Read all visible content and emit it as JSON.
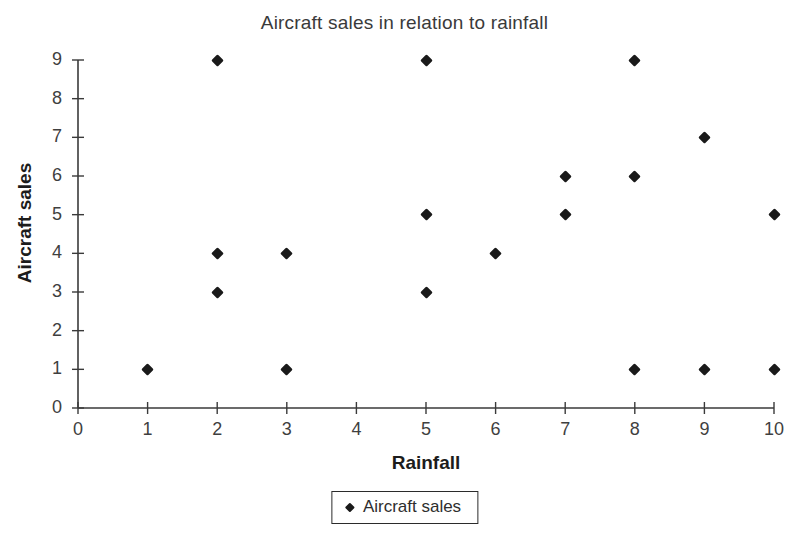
{
  "chart_data": {
    "type": "scatter",
    "title": "Aircraft sales in relation to rainfall",
    "xlabel": "Rainfall",
    "ylabel": "Aircraft sales",
    "xlim": [
      0,
      10
    ],
    "ylim": [
      0,
      9
    ],
    "xticks": [
      "0",
      "1",
      "2",
      "3",
      "4",
      "5",
      "6",
      "7",
      "8",
      "9",
      "10"
    ],
    "yticks": [
      "0",
      "1",
      "2",
      "3",
      "4",
      "5",
      "6",
      "7",
      "8",
      "9"
    ],
    "grid": false,
    "legend_position": "bottom-center",
    "marker": "diamond",
    "marker_color": "#1a1a1a",
    "series": [
      {
        "name": "Aircraft sales",
        "points": [
          [
            1,
            1
          ],
          [
            2,
            9
          ],
          [
            2,
            4
          ],
          [
            2,
            3
          ],
          [
            3,
            4
          ],
          [
            3,
            1
          ],
          [
            5,
            9
          ],
          [
            5,
            5
          ],
          [
            5,
            3
          ],
          [
            6,
            4
          ],
          [
            7,
            6
          ],
          [
            7,
            5
          ],
          [
            8,
            9
          ],
          [
            8,
            6
          ],
          [
            8,
            1
          ],
          [
            9,
            7
          ],
          [
            9,
            1
          ],
          [
            10,
            5
          ],
          [
            10,
            1
          ]
        ]
      }
    ]
  },
  "legend": {
    "entries": [
      {
        "label": "Aircraft sales"
      }
    ]
  }
}
